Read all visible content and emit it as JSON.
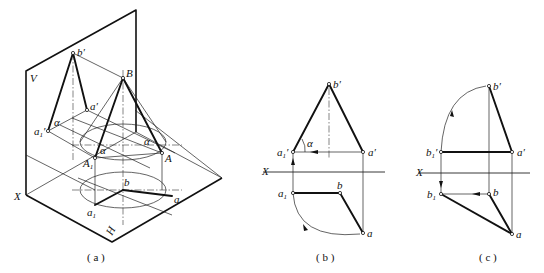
{
  "figure": {
    "panels": [
      {
        "id": "a",
        "caption": "( a )",
        "labels": {
          "V": "V",
          "H": "H",
          "X": "X",
          "b_prime": "b′",
          "B": "B",
          "a_prime": "a′",
          "a1_prime_base": "a",
          "a1_prime_sub": "1",
          "a1_prime_mark": "′",
          "alpha_v": "α",
          "alpha_1": "α",
          "alpha_2": "α",
          "A": "A",
          "A1_base": "A",
          "A1_sub": "1",
          "b": "b",
          "a": "a",
          "a1_base": "a",
          "a1_sub": "1"
        }
      },
      {
        "id": "b",
        "caption": "( b )",
        "labels": {
          "X": "X",
          "b_prime": "b′",
          "a_prime": "a′",
          "a1_prime_base": "a",
          "a1_prime_sub": "1",
          "a1_prime_mark": "′",
          "alpha": "α",
          "a1_base": "a",
          "a1_sub": "1",
          "b": "b",
          "a": "a"
        }
      },
      {
        "id": "c",
        "caption": "( c )",
        "labels": {
          "X": "X",
          "b_prime": "b′",
          "b1_prime_base": "b",
          "b1_prime_sub": "1",
          "b1_prime_mark": "′",
          "a_prime": "a′",
          "b1_base": "b",
          "b1_sub": "1",
          "b": "b",
          "a": "a"
        }
      }
    ]
  }
}
